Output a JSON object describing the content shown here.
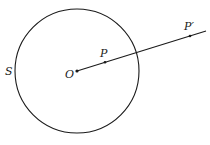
{
  "diagram": {
    "circle_label": "S",
    "center_label": "O",
    "point_label": "P",
    "image_point_label": "P′",
    "circle": {
      "cx": 77,
      "cy": 71,
      "r": 62
    },
    "ray": {
      "x1": 77,
      "y1": 71,
      "x2": 206,
      "y2": 31
    },
    "points": {
      "O": {
        "x": 77,
        "y": 71
      },
      "P": {
        "x": 105,
        "y": 62
      },
      "P_prime": {
        "x": 190,
        "y": 35
      }
    },
    "stroke_color": "#1a1a1a"
  }
}
